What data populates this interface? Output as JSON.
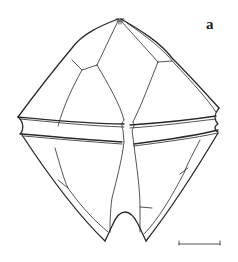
{
  "figure": {
    "panel_label": "a",
    "scale_bar": {
      "x1": 179,
      "x2": 220,
      "y": 244,
      "label": ""
    },
    "colors": {
      "line": "#2a2a2a",
      "background": "#ffffff"
    }
  }
}
